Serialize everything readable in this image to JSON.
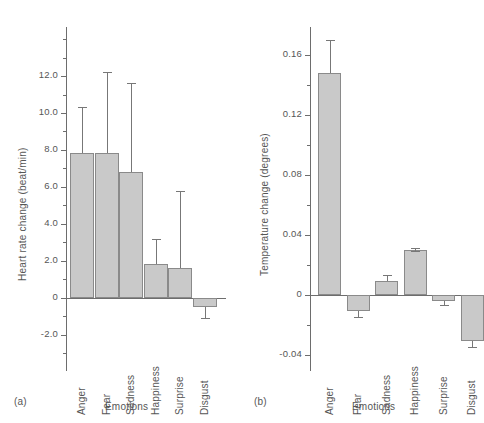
{
  "figure": {
    "panel_a_tag": "(a)",
    "panel_b_tag": "(b)"
  },
  "chart_data": [
    {
      "type": "bar",
      "panel": "(a)",
      "title": "",
      "xlabel": "Emotions",
      "ylabel": "Heart rate change (beat/min)",
      "categories": [
        "Anger",
        "Fear",
        "Sadness",
        "Happiness",
        "Surprise",
        "Disgust"
      ],
      "values": [
        7.85,
        7.85,
        6.8,
        1.85,
        1.6,
        -0.5
      ],
      "errors_upper": [
        10.3,
        12.2,
        11.6,
        3.2,
        5.8,
        null
      ],
      "errors_lower": [
        null,
        null,
        null,
        null,
        null,
        -1.1
      ],
      "ylim": [
        -2.6,
        12.8
      ],
      "yticks": [
        12.0,
        10.0,
        8.0,
        6.0,
        4.0,
        2.0,
        0,
        -2.0
      ],
      "ytick_labels": [
        "12.0",
        "10.0",
        "8.0",
        "6.0",
        "4.0",
        "2.0",
        "0",
        "-2.0"
      ],
      "minor_tick_step": 1.0,
      "grid": false,
      "legend": "none",
      "bar_gap": "none",
      "bar_color": "#c9c9c9",
      "bar_edge_color": "#8a8a8a"
    },
    {
      "type": "bar",
      "panel": "(b)",
      "title": "",
      "xlabel": "Emotions",
      "ylabel": "Temperature change (degrees)",
      "categories": [
        "Anger",
        "Fear",
        "Sadness",
        "Happiness",
        "Surprise",
        "Disgust"
      ],
      "values": [
        0.148,
        -0.011,
        0.009,
        0.03,
        -0.004,
        -0.031
      ],
      "errors_upper": [
        0.17,
        null,
        0.013,
        0.031,
        null,
        null
      ],
      "errors_lower": [
        null,
        -0.015,
        null,
        0.029,
        -0.007,
        -0.035
      ],
      "ylim": [
        -0.046,
        0.176
      ],
      "yticks": [
        0.16,
        0.12,
        0.08,
        0.04,
        0,
        -0.04
      ],
      "ytick_labels": [
        "0.16",
        "0.12",
        "0.08",
        "0.04",
        "0",
        "-0.04"
      ],
      "minor_tick_step": 0.02,
      "grid": false,
      "legend": "none",
      "bar_gap": "wide",
      "bar_color": "#c9c9c9",
      "bar_edge_color": "#8a8a8a"
    }
  ]
}
